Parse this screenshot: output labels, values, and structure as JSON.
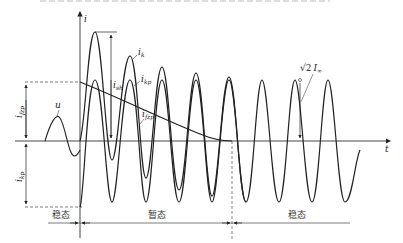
{
  "diagram": {
    "axes": {
      "y_label": "i",
      "x_label": "t"
    },
    "curve_labels": {
      "ik": {
        "base": "i",
        "sub": "k"
      },
      "ikp": {
        "base": "i",
        "sub": "kp"
      },
      "ifzp": {
        "base": "i",
        "sub": "fzp"
      },
      "ish": {
        "base": "i",
        "sub": "sh"
      },
      "u": "u",
      "ifzp_left": {
        "base": "i",
        "sub": "fzp"
      },
      "ikp_left": {
        "base": "i",
        "sub": "kp"
      },
      "steady_amp": {
        "prefix": "√2",
        "base": "I",
        "sub": "∞"
      }
    },
    "regions": [
      {
        "label": "稳态"
      },
      {
        "label": "暂态"
      },
      {
        "label": "稳态"
      }
    ]
  }
}
